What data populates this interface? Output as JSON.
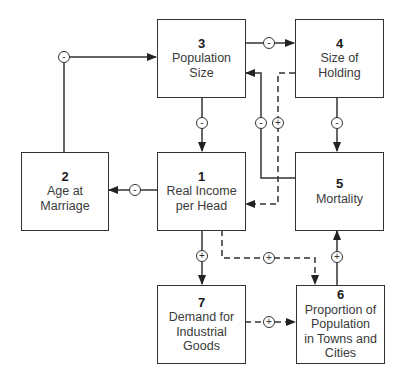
{
  "diagram": {
    "nodes": [
      {
        "id": "1",
        "number": "1",
        "label": "Real Income\nper Head"
      },
      {
        "id": "2",
        "number": "2",
        "label": "Age at\nMarriage"
      },
      {
        "id": "3",
        "number": "3",
        "label": "Population\nSize"
      },
      {
        "id": "4",
        "number": "4",
        "label": "Size of\nHolding"
      },
      {
        "id": "5",
        "number": "5",
        "label": "Mortality"
      },
      {
        "id": "6",
        "number": "6",
        "label": "Proportion of\nPopulation\nin Towns and\nCities"
      },
      {
        "id": "7",
        "number": "7",
        "label": "Demand for\nIndustrial\nGoods"
      }
    ],
    "edges": [
      {
        "from": "2",
        "to": "3",
        "sign": "-",
        "style": "solid"
      },
      {
        "from": "3",
        "to": "4",
        "sign": "-",
        "style": "solid"
      },
      {
        "from": "3",
        "to": "1",
        "sign": "-",
        "style": "solid"
      },
      {
        "from": "4",
        "to": "5",
        "sign": "-",
        "style": "solid"
      },
      {
        "from": "5",
        "to": "3",
        "sign": "-",
        "style": "solid"
      },
      {
        "from": "4",
        "to": "1",
        "sign": "+",
        "style": "dashed"
      },
      {
        "from": "1",
        "to": "2",
        "sign": "-",
        "style": "solid"
      },
      {
        "from": "1",
        "to": "7",
        "sign": "+",
        "style": "solid"
      },
      {
        "from": "1",
        "to": "6",
        "sign": "+",
        "style": "dashed"
      },
      {
        "from": "7",
        "to": "6",
        "sign": "+",
        "style": "dashed"
      },
      {
        "from": "6",
        "to": "5",
        "sign": "+",
        "style": "solid"
      }
    ],
    "signs": {
      "e2_3": "-",
      "e3_4": "-",
      "e3_1": "-",
      "e4_5": "-",
      "e5_3": "-",
      "e4_1": "+",
      "e1_2": "-",
      "e1_7": "+",
      "e1_6": "+",
      "e7_6": "+",
      "e6_5": "+"
    }
  }
}
